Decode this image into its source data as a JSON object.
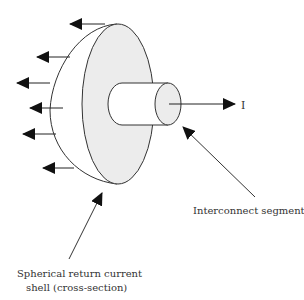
{
  "diagram": {
    "current_label": "I",
    "interconnect_label": "Interconnect segment",
    "shell_label_line1": "Spherical return current",
    "shell_label_line2": "shell (cross-section)"
  },
  "colors": {
    "stroke": "#333333",
    "fill_disk": "#ececec",
    "fill_cyl_end": "#ececec",
    "background": "#ffffff"
  }
}
